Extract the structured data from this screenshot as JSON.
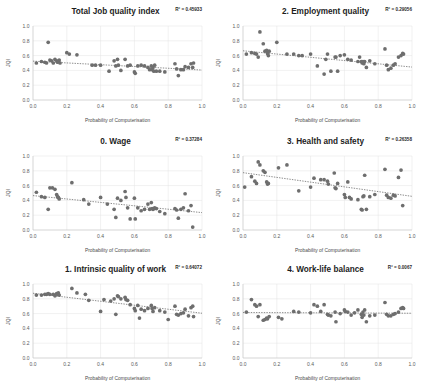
{
  "figure": {
    "name": "job-quality-vs-computerisation",
    "panel_count": 6,
    "shared": {
      "xlabel": "Probability of Computerisation",
      "ylabel": "JQI",
      "xticks": [
        "0.0",
        "0.2",
        "0.4",
        "0.6",
        "0.8",
        "1.0"
      ],
      "yticks": [
        "0.0",
        "0.2",
        "0.4",
        "0.6",
        "0.8",
        "1.0"
      ],
      "xlim": [
        0,
        1
      ],
      "ylim": [
        0,
        1
      ],
      "grid": true,
      "legend": "none",
      "point_color": "#6e6e6e",
      "trend_color": "#5a5a5a",
      "grid_color": "#e2e2e2",
      "title_color": "#1d1d1d"
    }
  },
  "chart_data": [
    {
      "type": "scatter",
      "title": "Total Job quality index",
      "r2_label": "R² = 0.45933",
      "r2": 0.45933,
      "xlabel": "Probability of Computerisation",
      "ylabel": "JQI",
      "xlim": [
        0,
        1
      ],
      "ylim": [
        0,
        1
      ],
      "trendline": {
        "x0": 0.0,
        "y0": 0.525,
        "x1": 1.0,
        "y1": 0.405
      },
      "points": [
        [
          0.02,
          0.5
        ],
        [
          0.05,
          0.52
        ],
        [
          0.07,
          0.51
        ],
        [
          0.08,
          0.5
        ],
        [
          0.09,
          0.78
        ],
        [
          0.1,
          0.54
        ],
        [
          0.11,
          0.53
        ],
        [
          0.12,
          0.5
        ],
        [
          0.13,
          0.55
        ],
        [
          0.14,
          0.53
        ],
        [
          0.145,
          0.51
        ],
        [
          0.15,
          0.52
        ],
        [
          0.155,
          0.54
        ],
        [
          0.16,
          0.5
        ],
        [
          0.2,
          0.64
        ],
        [
          0.215,
          0.62
        ],
        [
          0.26,
          0.61
        ],
        [
          0.35,
          0.47
        ],
        [
          0.37,
          0.47
        ],
        [
          0.4,
          0.47
        ],
        [
          0.45,
          0.39
        ],
        [
          0.48,
          0.53
        ],
        [
          0.49,
          0.46
        ],
        [
          0.5,
          0.55
        ],
        [
          0.505,
          0.47
        ],
        [
          0.52,
          0.4
        ],
        [
          0.545,
          0.55
        ],
        [
          0.56,
          0.46
        ],
        [
          0.575,
          0.47
        ],
        [
          0.6,
          0.38
        ],
        [
          0.605,
          0.36
        ],
        [
          0.62,
          0.46
        ],
        [
          0.64,
          0.47
        ],
        [
          0.66,
          0.46
        ],
        [
          0.68,
          0.44
        ],
        [
          0.69,
          0.41
        ],
        [
          0.7,
          0.46
        ],
        [
          0.705,
          0.41
        ],
        [
          0.71,
          0.44
        ],
        [
          0.715,
          0.39
        ],
        [
          0.72,
          0.47
        ],
        [
          0.73,
          0.39
        ],
        [
          0.75,
          0.39
        ],
        [
          0.78,
          0.38
        ],
        [
          0.84,
          0.49
        ],
        [
          0.85,
          0.42
        ],
        [
          0.86,
          0.33
        ],
        [
          0.875,
          0.41
        ],
        [
          0.89,
          0.41
        ],
        [
          0.9,
          0.45
        ],
        [
          0.92,
          0.44
        ],
        [
          0.935,
          0.49
        ],
        [
          0.945,
          0.44
        ],
        [
          0.95,
          0.5
        ]
      ]
    },
    {
      "type": "scatter",
      "title": "2. Employment quality",
      "r2_label": "R² = 0.29056",
      "r2": 0.29056,
      "xlabel": "Probability of Computerisation",
      "ylabel": "JQI",
      "xlim": [
        0,
        1
      ],
      "ylim": [
        0,
        1
      ],
      "trendline": {
        "x0": 0.0,
        "y0": 0.665,
        "x1": 1.0,
        "y1": 0.445
      },
      "points": [
        [
          0.02,
          0.62
        ],
        [
          0.05,
          0.64
        ],
        [
          0.07,
          0.63
        ],
        [
          0.08,
          0.62
        ],
        [
          0.09,
          0.58
        ],
        [
          0.1,
          0.92
        ],
        [
          0.12,
          0.76
        ],
        [
          0.13,
          0.66
        ],
        [
          0.14,
          0.67
        ],
        [
          0.145,
          0.63
        ],
        [
          0.15,
          0.6
        ],
        [
          0.155,
          0.66
        ],
        [
          0.2,
          0.78
        ],
        [
          0.26,
          0.62
        ],
        [
          0.3,
          0.62
        ],
        [
          0.33,
          0.6
        ],
        [
          0.35,
          0.6
        ],
        [
          0.4,
          0.62
        ],
        [
          0.44,
          0.46
        ],
        [
          0.48,
          0.35
        ],
        [
          0.49,
          0.55
        ],
        [
          0.5,
          0.62
        ],
        [
          0.52,
          0.39
        ],
        [
          0.545,
          0.58
        ],
        [
          0.55,
          0.58
        ],
        [
          0.56,
          0.39
        ],
        [
          0.575,
          0.6
        ],
        [
          0.6,
          0.61
        ],
        [
          0.62,
          0.55
        ],
        [
          0.64,
          0.54
        ],
        [
          0.68,
          0.52
        ],
        [
          0.69,
          0.58
        ],
        [
          0.7,
          0.52
        ],
        [
          0.705,
          0.5
        ],
        [
          0.71,
          0.52
        ],
        [
          0.715,
          0.49
        ],
        [
          0.72,
          0.52
        ],
        [
          0.73,
          0.44
        ],
        [
          0.75,
          0.53
        ],
        [
          0.78,
          0.49
        ],
        [
          0.84,
          0.69
        ],
        [
          0.85,
          0.47
        ],
        [
          0.86,
          0.41
        ],
        [
          0.875,
          0.43
        ],
        [
          0.89,
          0.47
        ],
        [
          0.9,
          0.49
        ],
        [
          0.92,
          0.58
        ],
        [
          0.935,
          0.6
        ],
        [
          0.945,
          0.63
        ],
        [
          0.95,
          0.62
        ]
      ]
    },
    {
      "type": "scatter",
      "title": "0. Wage",
      "r2_label": "R² = 0.37284",
      "r2": 0.37284,
      "xlabel": "Probability of Computerisation",
      "ylabel": "JQI",
      "xlim": [
        0,
        1
      ],
      "ylim": [
        0,
        1
      ],
      "trendline": {
        "x0": 0.0,
        "y0": 0.465,
        "x1": 1.0,
        "y1": 0.235
      },
      "points": [
        [
          0.02,
          0.51
        ],
        [
          0.05,
          0.45
        ],
        [
          0.07,
          0.44
        ],
        [
          0.09,
          0.28
        ],
        [
          0.1,
          0.57
        ],
        [
          0.115,
          0.57
        ],
        [
          0.13,
          0.55
        ],
        [
          0.14,
          0.48
        ],
        [
          0.145,
          0.45
        ],
        [
          0.15,
          0.44
        ],
        [
          0.155,
          0.42
        ],
        [
          0.23,
          0.64
        ],
        [
          0.3,
          0.41
        ],
        [
          0.33,
          0.35
        ],
        [
          0.4,
          0.44
        ],
        [
          0.44,
          0.35
        ],
        [
          0.48,
          0.28
        ],
        [
          0.49,
          0.17
        ],
        [
          0.5,
          0.43
        ],
        [
          0.52,
          0.4
        ],
        [
          0.545,
          0.52
        ],
        [
          0.55,
          0.44
        ],
        [
          0.56,
          0.3
        ],
        [
          0.575,
          0.15
        ],
        [
          0.6,
          0.43
        ],
        [
          0.605,
          0.15
        ],
        [
          0.62,
          0.3
        ],
        [
          0.64,
          0.26
        ],
        [
          0.66,
          0.28
        ],
        [
          0.68,
          0.35
        ],
        [
          0.69,
          0.28
        ],
        [
          0.7,
          0.37
        ],
        [
          0.705,
          0.29
        ],
        [
          0.71,
          0.28
        ],
        [
          0.715,
          0.29
        ],
        [
          0.72,
          0.3
        ],
        [
          0.73,
          0.29
        ],
        [
          0.75,
          0.25
        ],
        [
          0.78,
          0.22
        ],
        [
          0.84,
          0.29
        ],
        [
          0.85,
          0.27
        ],
        [
          0.86,
          0.16
        ],
        [
          0.875,
          0.28
        ],
        [
          0.89,
          0.3
        ],
        [
          0.9,
          0.49
        ],
        [
          0.92,
          0.26
        ],
        [
          0.935,
          0.33
        ],
        [
          0.945,
          0.04
        ]
      ]
    },
    {
      "type": "scatter",
      "title": "3. Health and safety",
      "r2_label": "R² = 0.26358",
      "r2": 0.26358,
      "xlabel": "Probability of Computerisation",
      "ylabel": "JQI",
      "xlim": [
        0,
        1
      ],
      "ylim": [
        0,
        1
      ],
      "trendline": {
        "x0": 0.0,
        "y0": 0.775,
        "x1": 1.0,
        "y1": 0.455
      },
      "points": [
        [
          0.01,
          0.58
        ],
        [
          0.05,
          0.72
        ],
        [
          0.07,
          0.66
        ],
        [
          0.08,
          0.63
        ],
        [
          0.09,
          0.92
        ],
        [
          0.1,
          0.88
        ],
        [
          0.12,
          0.8
        ],
        [
          0.13,
          0.78
        ],
        [
          0.14,
          0.65
        ],
        [
          0.145,
          0.62
        ],
        [
          0.15,
          0.63
        ],
        [
          0.21,
          0.84
        ],
        [
          0.26,
          0.88
        ],
        [
          0.33,
          0.53
        ],
        [
          0.4,
          0.58
        ],
        [
          0.42,
          0.7
        ],
        [
          0.46,
          0.68
        ],
        [
          0.48,
          0.68
        ],
        [
          0.5,
          0.66
        ],
        [
          0.505,
          0.62
        ],
        [
          0.54,
          0.77
        ],
        [
          0.545,
          0.57
        ],
        [
          0.55,
          0.56
        ],
        [
          0.56,
          0.63
        ],
        [
          0.6,
          0.48
        ],
        [
          0.605,
          0.44
        ],
        [
          0.62,
          0.65
        ],
        [
          0.63,
          0.44
        ],
        [
          0.64,
          0.42
        ],
        [
          0.68,
          0.41
        ],
        [
          0.7,
          0.28
        ],
        [
          0.705,
          0.27
        ],
        [
          0.71,
          0.45
        ],
        [
          0.715,
          0.46
        ],
        [
          0.72,
          0.74
        ],
        [
          0.73,
          0.28
        ],
        [
          0.75,
          0.45
        ],
        [
          0.78,
          0.48
        ],
        [
          0.84,
          0.82
        ],
        [
          0.85,
          0.47
        ],
        [
          0.86,
          0.44
        ],
        [
          0.875,
          0.43
        ],
        [
          0.89,
          0.47
        ],
        [
          0.9,
          0.46
        ],
        [
          0.92,
          0.71
        ],
        [
          0.935,
          0.81
        ],
        [
          0.945,
          0.33
        ]
      ]
    },
    {
      "type": "scatter",
      "title": "1. Intrinsic quality of work",
      "r2_label": "R² = 0.64072",
      "r2": 0.64072,
      "xlabel": "Probability of Computerisation",
      "ylabel": "JQI",
      "xlim": [
        0,
        1
      ],
      "ylim": [
        0,
        1
      ],
      "trendline": {
        "x0": 0.0,
        "y0": 0.875,
        "x1": 1.0,
        "y1": 0.605
      },
      "points": [
        [
          0.02,
          0.85
        ],
        [
          0.05,
          0.85
        ],
        [
          0.07,
          0.86
        ],
        [
          0.08,
          0.86
        ],
        [
          0.09,
          0.87
        ],
        [
          0.1,
          0.86
        ],
        [
          0.12,
          0.86
        ],
        [
          0.13,
          0.84
        ],
        [
          0.14,
          0.87
        ],
        [
          0.145,
          0.86
        ],
        [
          0.15,
          0.88
        ],
        [
          0.155,
          0.85
        ],
        [
          0.23,
          0.94
        ],
        [
          0.26,
          0.88
        ],
        [
          0.31,
          0.86
        ],
        [
          0.33,
          0.78
        ],
        [
          0.4,
          0.63
        ],
        [
          0.42,
          0.79
        ],
        [
          0.46,
          0.77
        ],
        [
          0.48,
          0.8
        ],
        [
          0.49,
          0.59
        ],
        [
          0.5,
          0.84
        ],
        [
          0.505,
          0.83
        ],
        [
          0.52,
          0.8
        ],
        [
          0.545,
          0.82
        ],
        [
          0.55,
          0.79
        ],
        [
          0.56,
          0.78
        ],
        [
          0.575,
          0.72
        ],
        [
          0.6,
          0.67
        ],
        [
          0.605,
          0.64
        ],
        [
          0.62,
          0.71
        ],
        [
          0.63,
          0.54
        ],
        [
          0.64,
          0.66
        ],
        [
          0.66,
          0.64
        ],
        [
          0.68,
          0.67
        ],
        [
          0.7,
          0.71
        ],
        [
          0.705,
          0.67
        ],
        [
          0.71,
          0.63
        ],
        [
          0.72,
          0.68
        ],
        [
          0.75,
          0.64
        ],
        [
          0.78,
          0.62
        ],
        [
          0.8,
          0.52
        ],
        [
          0.84,
          0.7
        ],
        [
          0.85,
          0.59
        ],
        [
          0.86,
          0.58
        ],
        [
          0.875,
          0.6
        ],
        [
          0.89,
          0.61
        ],
        [
          0.9,
          0.66
        ],
        [
          0.92,
          0.57
        ],
        [
          0.935,
          0.68
        ],
        [
          0.945,
          0.7
        ],
        [
          0.95,
          0.56
        ]
      ]
    },
    {
      "type": "scatter",
      "title": "4. Work-life balance",
      "r2_label": "R² = 0.0067",
      "r2": 0.0067,
      "xlabel": "Probability of Computerisation",
      "ylabel": "JQI",
      "xlim": [
        0,
        1
      ],
      "ylim": [
        0,
        1
      ],
      "trendline": {
        "x0": 0.0,
        "y0": 0.615,
        "x1": 1.0,
        "y1": 0.605
      },
      "points": [
        [
          0.02,
          0.62
        ],
        [
          0.05,
          0.79
        ],
        [
          0.07,
          0.72
        ],
        [
          0.08,
          0.7
        ],
        [
          0.09,
          0.56
        ],
        [
          0.1,
          0.72
        ],
        [
          0.12,
          0.51
        ],
        [
          0.13,
          0.52
        ],
        [
          0.14,
          0.54
        ],
        [
          0.145,
          0.53
        ],
        [
          0.155,
          0.56
        ],
        [
          0.21,
          0.55
        ],
        [
          0.23,
          0.53
        ],
        [
          0.3,
          0.63
        ],
        [
          0.33,
          0.62
        ],
        [
          0.4,
          0.61
        ],
        [
          0.42,
          0.72
        ],
        [
          0.44,
          0.7
        ],
        [
          0.46,
          0.63
        ],
        [
          0.48,
          0.72
        ],
        [
          0.5,
          0.59
        ],
        [
          0.505,
          0.58
        ],
        [
          0.52,
          0.57
        ],
        [
          0.545,
          0.62
        ],
        [
          0.55,
          0.49
        ],
        [
          0.575,
          0.6
        ],
        [
          0.6,
          0.65
        ],
        [
          0.605,
          0.63
        ],
        [
          0.62,
          0.62
        ],
        [
          0.64,
          0.58
        ],
        [
          0.66,
          0.61
        ],
        [
          0.68,
          0.65
        ],
        [
          0.7,
          0.59
        ],
        [
          0.705,
          0.55
        ],
        [
          0.71,
          0.62
        ],
        [
          0.715,
          0.58
        ],
        [
          0.72,
          0.65
        ],
        [
          0.73,
          0.49
        ],
        [
          0.75,
          0.57
        ],
        [
          0.78,
          0.58
        ],
        [
          0.84,
          0.75
        ],
        [
          0.85,
          0.59
        ],
        [
          0.86,
          0.57
        ],
        [
          0.875,
          0.57
        ],
        [
          0.89,
          0.59
        ],
        [
          0.9,
          0.6
        ],
        [
          0.92,
          0.62
        ],
        [
          0.935,
          0.67
        ],
        [
          0.945,
          0.68
        ],
        [
          0.95,
          0.67
        ]
      ]
    }
  ]
}
